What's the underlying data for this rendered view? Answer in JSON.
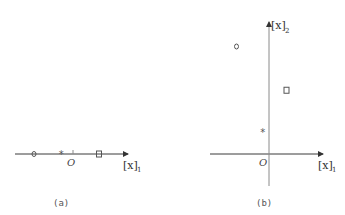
{
  "panels": [
    {
      "id": "a",
      "caption": "(a)",
      "origin_label": "O",
      "x_axis_label": "[x]",
      "x_axis_subscript": "1",
      "points": [
        {
          "marker": "circle",
          "x": -3.0
        },
        {
          "marker": "star",
          "x": -0.9
        },
        {
          "marker": "square",
          "x": 2.0
        }
      ]
    },
    {
      "id": "b",
      "caption": "(b)",
      "origin_label": "O",
      "x_axis_label": "[x]",
      "x_axis_subscript": "1",
      "y_axis_label": "[x]",
      "y_axis_subscript": "2",
      "points": [
        {
          "marker": "circle",
          "x": -2.6,
          "y": 8.6
        },
        {
          "marker": "square",
          "x": 1.4,
          "y": 5.1
        },
        {
          "marker": "star",
          "x": -0.5,
          "y": 1.8
        }
      ]
    }
  ]
}
